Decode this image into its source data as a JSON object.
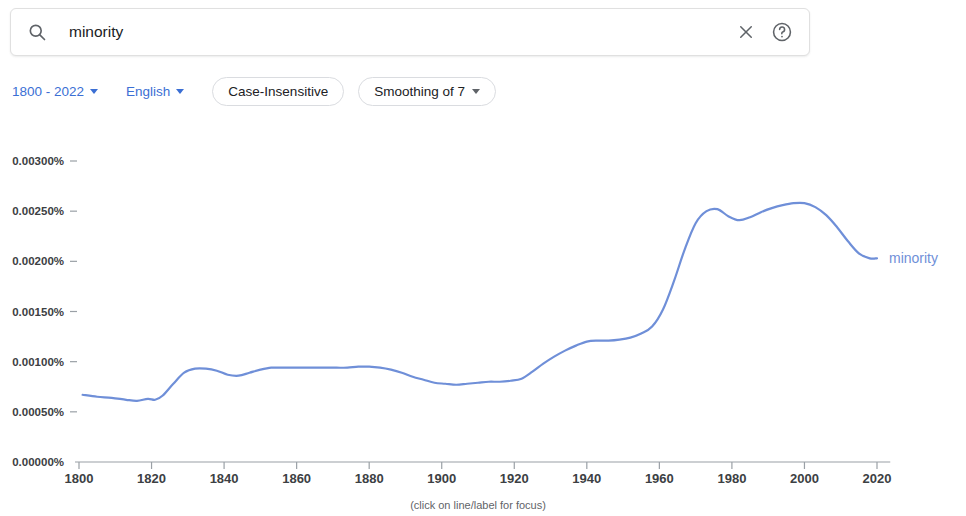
{
  "search": {
    "query": "minority",
    "placeholder": "Search in Google Books",
    "search_icon": "search-icon",
    "clear_icon": "close-icon",
    "help_icon": "help-circle-icon"
  },
  "controls": {
    "date_range": "1800 - 2022",
    "language": "English",
    "case_sensitivity": "Case-Insensitive",
    "smoothing": "Smoothing of 7"
  },
  "chart_caption": "(click on line/label for focus)",
  "colors": {
    "series_line": "#6f8fd8",
    "link": "#3b6fd4",
    "axis": "#9aa0a6",
    "gridline": "#f1f3f4",
    "tick_text": "#3c4043"
  },
  "chart_data": {
    "type": "line",
    "title": "",
    "xlabel": "",
    "ylabel": "",
    "xlim": [
      1800,
      2022
    ],
    "ylim": [
      0.0,
      0.003
    ],
    "grid": false,
    "legend": "right-inline",
    "ytick_labels": [
      "0.00300%",
      "0.00250%",
      "0.00200%",
      "0.00150%",
      "0.00100%",
      "0.00050%",
      "0.00000%"
    ],
    "ytick_values": [
      0.003,
      0.0025,
      0.002,
      0.0015,
      0.001,
      0.0005,
      0.0
    ],
    "xtick_labels": [
      "1800",
      "1820",
      "1840",
      "1860",
      "1880",
      "1900",
      "1920",
      "1940",
      "1960",
      "1980",
      "2000",
      "2020"
    ],
    "xtick_values": [
      1800,
      1820,
      1840,
      1860,
      1880,
      1900,
      1920,
      1940,
      1960,
      1980,
      2000,
      2020
    ],
    "series": [
      {
        "name": "minority",
        "label": "minority",
        "color": "#6f8fd8",
        "x": [
          1801,
          1805,
          1809,
          1813,
          1816,
          1819,
          1821,
          1823,
          1826,
          1829,
          1832,
          1835,
          1838,
          1841,
          1844,
          1847,
          1850,
          1853,
          1856,
          1859,
          1862,
          1865,
          1868,
          1871,
          1874,
          1877,
          1880,
          1883,
          1886,
          1889,
          1892,
          1895,
          1898,
          1901,
          1904,
          1907,
          1910,
          1913,
          1916,
          1919,
          1922,
          1925,
          1928,
          1931,
          1934,
          1937,
          1940,
          1943,
          1946,
          1949,
          1952,
          1955,
          1958,
          1961,
          1964,
          1967,
          1970,
          1973,
          1976,
          1979,
          1982,
          1985,
          1988,
          1991,
          1994,
          1997,
          2000,
          2003,
          2006,
          2009,
          2012,
          2015,
          2018,
          2020
        ],
        "y": [
          0.00067,
          0.00065,
          0.00064,
          0.00062,
          0.00061,
          0.00063,
          0.00062,
          0.00066,
          0.00078,
          0.00089,
          0.00093,
          0.00093,
          0.00091,
          0.00087,
          0.00086,
          0.00089,
          0.00092,
          0.00094,
          0.00094,
          0.00094,
          0.00094,
          0.00094,
          0.00094,
          0.00094,
          0.00094,
          0.00095,
          0.00095,
          0.00094,
          0.00092,
          0.00089,
          0.00085,
          0.00082,
          0.00079,
          0.00078,
          0.00077,
          0.00078,
          0.00079,
          0.0008,
          0.0008,
          0.00081,
          0.00083,
          0.0009,
          0.00098,
          0.00105,
          0.00111,
          0.00116,
          0.0012,
          0.00121,
          0.00121,
          0.00122,
          0.00124,
          0.00128,
          0.00135,
          0.00152,
          0.0018,
          0.00212,
          0.00238,
          0.0025,
          0.00252,
          0.00245,
          0.00241,
          0.00244,
          0.00249,
          0.00253,
          0.00256,
          0.00258,
          0.00258,
          0.00254,
          0.00246,
          0.00234,
          0.0022,
          0.00208,
          0.00203,
          0.00203
        ]
      }
    ]
  }
}
